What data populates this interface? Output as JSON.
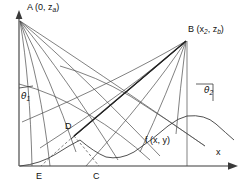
{
  "figure": {
    "background_color": "#ffffff",
    "line_color": "#4a4a4a",
    "width": 252,
    "height": 193
  },
  "labels": {
    "point_a": "A (0, z",
    "point_a_sub": "a",
    "point_a_close": ")",
    "point_b": "B (x",
    "point_b_sub1": "2",
    "point_b_mid": ", z",
    "point_b_sub2": "b",
    "point_b_close": ")",
    "theta1": "θ",
    "theta1_sub": "1",
    "theta2": "θ",
    "theta2_sub": "2",
    "point_d": "D",
    "point_e": "E",
    "point_c": "C",
    "function_label": "f (x, y)",
    "axis_x": "x"
  },
  "geometry": {
    "origin": {
      "x": 19,
      "y": 166
    },
    "point_a": {
      "x": 19,
      "y": 20
    },
    "point_b": {
      "x": 187,
      "y": 40
    },
    "point_d": {
      "x": 74,
      "y": 135
    },
    "point_e": {
      "x": 41,
      "y": 166
    },
    "point_c": {
      "x": 99,
      "y": 166
    },
    "x_axis_end": {
      "x": 235,
      "y": 166
    },
    "y_axis_top": {
      "x": 19,
      "y": 14
    },
    "b_vertical_foot": {
      "x": 187,
      "y": 166
    },
    "rays_from_a_count": 6,
    "rays_from_b_count": 5,
    "has_arc_from_a": true,
    "has_arc_from_b": true,
    "dashed_segments": 2
  }
}
